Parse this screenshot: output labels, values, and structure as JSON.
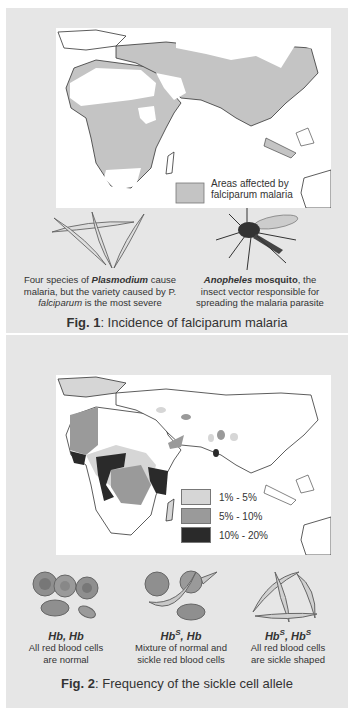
{
  "figure1": {
    "legend_label_line1": "Areas affected by",
    "legend_label_line2": "falciparum malaria",
    "legend_color": "#c4c4c4",
    "plasmodium_caption": {
      "line1_prefix": "Four species of ",
      "line1_bold_italic": "Plasmodium",
      "line1_suffix": " cause",
      "line2": "malaria, but the variety caused by P.",
      "line3_italic": "falciparum",
      "line3_suffix": " is the most severe"
    },
    "mosquito_caption": {
      "line1_bold_italic": "Anopheles",
      "line1_bold": " mosquito",
      "line1_suffix": ", the",
      "line2": "insect vector responsible for",
      "line3": "spreading the malaria parasite"
    },
    "title_bold": "Fig. 1",
    "title_rest": ":  Incidence of falciparum malaria"
  },
  "figure2": {
    "legend": [
      {
        "label": "1% - 5%",
        "color": "#d6d6d6"
      },
      {
        "label": "5% - 10%",
        "color": "#9a9a9a"
      },
      {
        "label": "10% - 20%",
        "color": "#2a2a2a"
      }
    ],
    "genotypes": [
      {
        "name_base1": "Hb",
        "sup1": "",
        "name_base2": "Hb",
        "sup2": "",
        "desc_line1": "All red blood cells",
        "desc_line2": "are normal"
      },
      {
        "name_base1": "Hb",
        "sup1": "S",
        "name_base2": "Hb",
        "sup2": "",
        "desc_line1": "Mixture of normal and",
        "desc_line2": "sickle red blood cells"
      },
      {
        "name_base1": "Hb",
        "sup1": "S",
        "name_base2": "Hb",
        "sup2": "S",
        "desc_line1": "All red blood cells",
        "desc_line2": "are sickle shaped"
      }
    ],
    "title_bold": "Fig. 2",
    "title_rest": ":  Frequency of the sickle cell allele"
  }
}
